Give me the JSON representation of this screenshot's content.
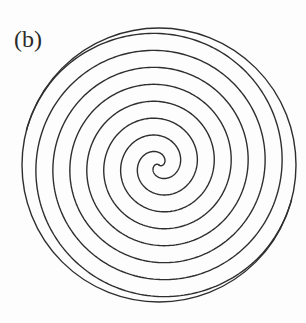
{
  "figure": {
    "panel_label": "(b)"
  },
  "spiral": {
    "center": [
      159,
      165
    ],
    "outer_circle_radius": 137,
    "arm_count": 2,
    "radial_gap_between_lines": 17,
    "pitch_per_arm_turn": 34,
    "start_angle_rad": 3.88,
    "max_arm_radius": 136,
    "turns_per_arm": 4,
    "stroke_color": "#2e2e2e",
    "stroke_width": 1.4
  },
  "colors": {
    "background": "#fdfdfd",
    "line": "#2e2e2e",
    "label": "#2a2a2a"
  }
}
